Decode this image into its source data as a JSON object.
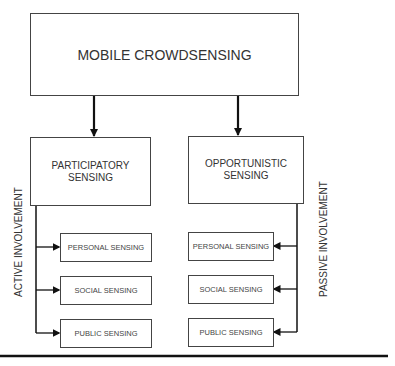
{
  "diagram": {
    "root": {
      "label": "MOBILE CROWDSENSING"
    },
    "branches": [
      {
        "label_line1": "PARTICIPATORY",
        "label_line2": "SENSING",
        "side_label": "ACTIVE INVOLVEMENT",
        "children": [
          "PERSONAL SENSING",
          "SOCIAL SENSING",
          "PUBLIC SENSING"
        ]
      },
      {
        "label_line1": "OPPORTUNISTIC",
        "label_line2": "SENSING",
        "side_label": "PASSIVE INVOLVEMENT",
        "children": [
          "PERSONAL SENSING",
          "SOCIAL SENSING",
          "PUBLIC SENSING"
        ]
      }
    ]
  }
}
